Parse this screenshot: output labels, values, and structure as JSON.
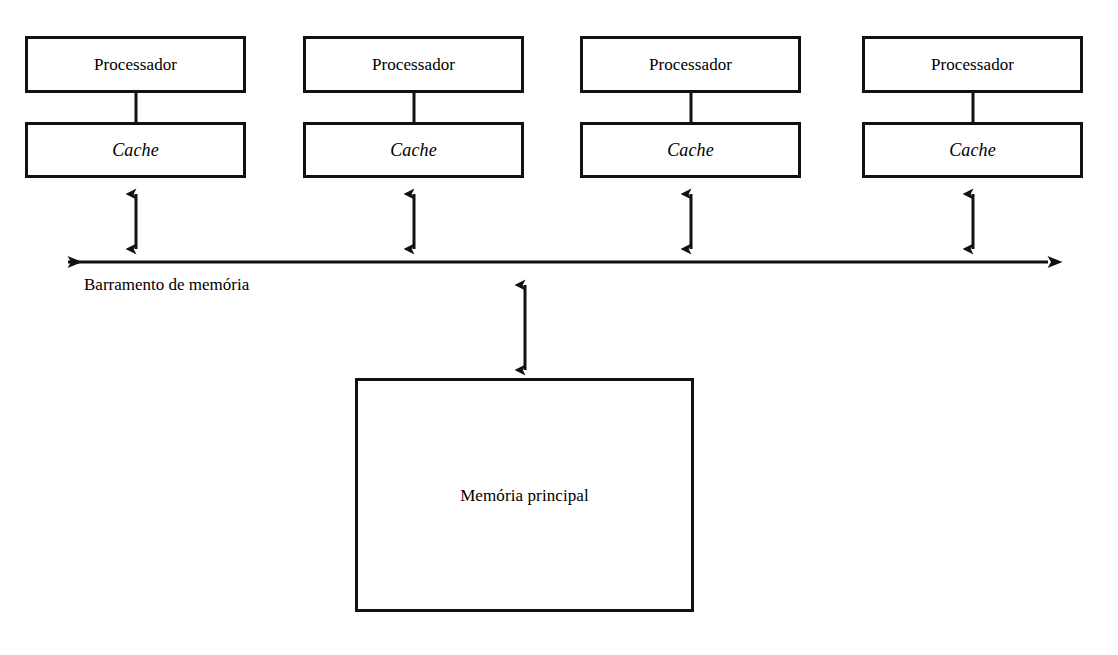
{
  "diagram": {
    "background_color": "#ffffff",
    "stroke_color": "#111111",
    "columns": [
      {
        "processor_label": "Processador",
        "cache_label": "Cache"
      },
      {
        "processor_label": "Processador",
        "cache_label": "Cache"
      },
      {
        "processor_label": "Processador",
        "cache_label": "Cache"
      },
      {
        "processor_label": "Processador",
        "cache_label": "Cache"
      }
    ],
    "bus": {
      "label": "Barramento de memória"
    },
    "memory": {
      "label": "Memória principal"
    }
  }
}
